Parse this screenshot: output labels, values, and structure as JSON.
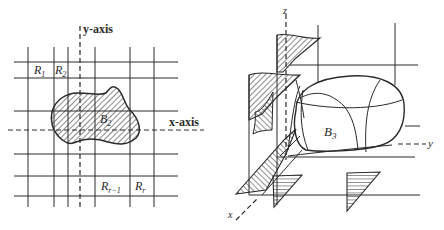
{
  "figure_left": {
    "y_axis_label": "y-axis",
    "x_axis_label": "x-axis",
    "region_label": "B",
    "region_sub": "2",
    "cells": [
      {
        "main": "R",
        "sub": "1"
      },
      {
        "main": "R",
        "sub": "2"
      },
      {
        "main": "R",
        "sub": "r−1"
      },
      {
        "main": "R",
        "sub": "r"
      }
    ]
  },
  "figure_right": {
    "z_axis_label": "z",
    "y_axis_label": "y",
    "x_axis_label": "x",
    "solid_label": "B",
    "solid_sub": "3"
  },
  "colors": {
    "ink": "#2a2a2a",
    "background": "#ffffff"
  }
}
